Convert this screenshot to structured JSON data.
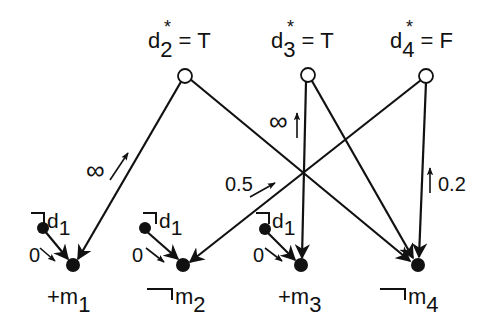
{
  "diagram": {
    "top_nodes": [
      {
        "id": "d2",
        "base": "d",
        "sub": "2",
        "star": "*",
        "eq": " = T"
      },
      {
        "id": "d3",
        "base": "d",
        "sub": "3",
        "star": "*",
        "eq": " = T"
      },
      {
        "id": "d4",
        "base": "d",
        "sub": "4",
        "star": "*",
        "eq": " = F"
      }
    ],
    "bottom_nodes": [
      {
        "id": "m1",
        "prefix": "+",
        "base": "m",
        "sub": "1",
        "negated": false
      },
      {
        "id": "m2",
        "prefix": "",
        "base": "m",
        "sub": "2",
        "negated": true
      },
      {
        "id": "m3",
        "prefix": "+",
        "base": "m",
        "sub": "3",
        "negated": false
      },
      {
        "id": "m4",
        "prefix": "",
        "base": "m",
        "sub": "4",
        "negated": true
      }
    ],
    "d1_nodes": [
      {
        "base": "d",
        "sub": "1",
        "negated": true,
        "edge_label": "0"
      },
      {
        "base": "d",
        "sub": "1",
        "negated": true,
        "edge_label": "0"
      },
      {
        "base": "d",
        "sub": "1",
        "negated": true,
        "edge_label": "0"
      }
    ],
    "edges": [
      {
        "from": "d2",
        "to": "m1",
        "label": "∞"
      },
      {
        "from": "d2",
        "to": "m4",
        "label": ""
      },
      {
        "from": "d3",
        "to": "m3",
        "label": "∞"
      },
      {
        "from": "d3",
        "to": "m4",
        "label": ""
      },
      {
        "from": "d4",
        "to": "m2",
        "label": "0.5"
      },
      {
        "from": "d4",
        "to": "m4",
        "label": "0.2"
      },
      {
        "from": "¬d1",
        "to": "m1",
        "label": "0"
      },
      {
        "from": "¬d1",
        "to": "m2",
        "label": "0"
      },
      {
        "from": "¬d1",
        "to": "m3",
        "label": "0"
      }
    ],
    "edge_labels": {
      "inf_d2_m1": "∞",
      "inf_d3_m3": "∞",
      "w_d4_m2": "0.5",
      "w_d4_m4": "0.2",
      "zero_1": "0",
      "zero_2": "0",
      "zero_3": "0"
    },
    "colors": {
      "ink": "#111111",
      "background": "#ffffff"
    }
  }
}
